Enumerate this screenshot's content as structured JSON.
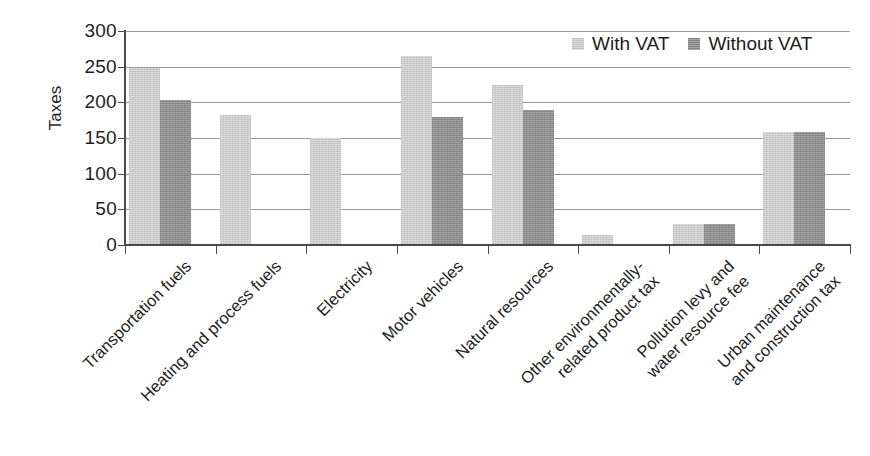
{
  "chart_data": {
    "type": "bar",
    "title": "",
    "xlabel": "",
    "ylabel": "Taxes",
    "ylim": [
      0,
      300
    ],
    "yticks": [
      0,
      50,
      100,
      150,
      200,
      250,
      300
    ],
    "ytick_labels": [
      "0",
      "50",
      "100",
      "150",
      "200",
      "250",
      "300"
    ],
    "grid": true,
    "legend_position": "top-right",
    "categories": [
      "Transportation fuels",
      "Heating and process fuels",
      "Electricity",
      "Motor vehicles",
      "Natural resources",
      "Other environmentally-related product tax",
      "Pollution levy and water resource fee",
      "Urban maintenance and construction tax"
    ],
    "category_label_lines": [
      [
        "Transportation fuels"
      ],
      [
        "Heating and process fuels"
      ],
      [
        "Electricity"
      ],
      [
        "Motor vehicles"
      ],
      [
        "Natural resources"
      ],
      [
        "Other environmentally-",
        "related product tax"
      ],
      [
        "Pollution levy and",
        "water resource fee"
      ],
      [
        "Urban maintenance",
        "and construction tax"
      ]
    ],
    "series": [
      {
        "name": "With VAT",
        "color": "#d2d2d2",
        "values": [
          248,
          182,
          150,
          265,
          225,
          14,
          29,
          158
        ]
      },
      {
        "name": "Without VAT",
        "color": "#8c8c8c",
        "values": [
          203,
          0,
          0,
          180,
          189,
          0,
          29,
          159
        ]
      }
    ]
  },
  "legend": {
    "items": [
      {
        "label": "With VAT",
        "swatch": "light"
      },
      {
        "label": "Without VAT",
        "swatch": "dark"
      }
    ]
  },
  "axis": {
    "y_title": "Taxes"
  },
  "colors": {
    "series_light": "#d2d2d2",
    "series_dark": "#8c8c8c",
    "axis": "#4a4a4a",
    "grid": "#9a9a9a",
    "text": "#1e1e1e",
    "background": "#ffffff"
  }
}
